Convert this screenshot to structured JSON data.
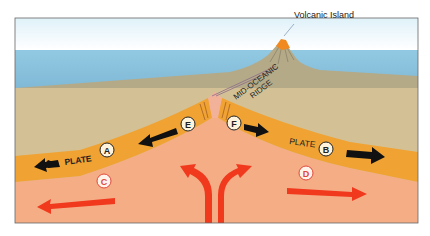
{
  "diagram": {
    "labels": {
      "volcanic_island": "Volcanic Island",
      "ridge_line1": "MID-OCEANIC",
      "ridge_line2": "RIDGE",
      "plate_a": "PLATE",
      "plate_b": "PLATE"
    },
    "markers": {
      "a": "A",
      "b": "B",
      "c": "C",
      "d": "D",
      "e": "E",
      "f": "F"
    },
    "colors": {
      "sky": "#e8f5fb",
      "ocean": "#8cc5e0",
      "seafloor": "#b5ab8a",
      "sediment": "#d2bf93",
      "plate": "#f0a030",
      "mantle": "#f6ad85",
      "convection_arrow": "#f0361c",
      "plate_arrow": "#111111",
      "frame": "#555555"
    }
  }
}
